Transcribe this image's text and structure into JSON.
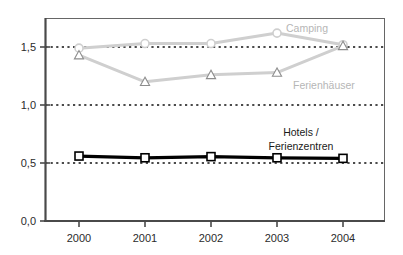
{
  "figure": {
    "background": "#ffffff",
    "plot_border_color": "#555555",
    "axis_color": "#4a4a4a",
    "gridline_color": "#111111"
  },
  "axes": {
    "y_tick_labels": [
      "1,5",
      "1,0",
      "0,5",
      "0,0"
    ],
    "y_tick_values": [
      1.5,
      1.0,
      0.5,
      0.0
    ],
    "x_tick_labels": [
      "2000",
      "2001",
      "2002",
      "2003",
      "2004"
    ]
  },
  "series_labels": {
    "camping": "Camping",
    "ferienhaeuser": "Ferienhäuser",
    "hotels_line1": "Hotels /",
    "hotels_line2": "Ferienzentren"
  },
  "chart_data": {
    "type": "line",
    "title": "",
    "xlabel": "",
    "ylabel": "",
    "x": [
      "2000",
      "2001",
      "2002",
      "2003",
      "2004"
    ],
    "ylim": [
      0.0,
      1.75
    ],
    "yticks": [
      0.0,
      0.5,
      1.0,
      1.5
    ],
    "ytick_labels": [
      "0,0",
      "0,5",
      "1,0",
      "1,5"
    ],
    "grid": "horizontal-dotted",
    "legend": "inline-annotations",
    "series": [
      {
        "name": "Camping",
        "color": "#cfcfcf",
        "marker": "circle",
        "marker_fill": "#ffffff",
        "values": [
          1.49,
          1.53,
          1.53,
          1.62,
          1.52
        ]
      },
      {
        "name": "Ferienhäuser",
        "color": "#cfcfcf",
        "marker": "triangle",
        "marker_fill": "#ffffff",
        "values": [
          1.43,
          1.2,
          1.26,
          1.28,
          1.51
        ]
      },
      {
        "name": "Hotels / Ferienzentren",
        "color": "#000000",
        "marker": "square",
        "marker_fill": "#ffffff",
        "values": [
          0.56,
          0.545,
          0.555,
          0.545,
          0.54
        ]
      }
    ]
  }
}
